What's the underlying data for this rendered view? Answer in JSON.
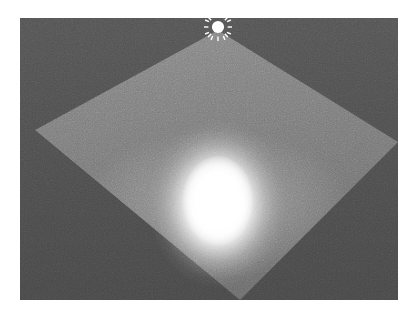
{
  "app": {
    "title": "3D Light Viewport",
    "scene_name": "Point light on ground plane"
  },
  "viewport": {
    "label": "render-viewport",
    "width_px": 378,
    "height_px": 282,
    "background_color": "#4c4c4c",
    "frame_color": "#6e6e6e"
  },
  "scene": {
    "ground_plane": {
      "label": "ground-plane",
      "shape": "quad",
      "base_color": "#787878",
      "highlight_color": "#8a8a8a",
      "shadow_color": "#676767",
      "grid_color": "#787878",
      "grid_visible_in_highlight": true,
      "corners_percent": [
        {
          "name": "top",
          "x": 52.4,
          "y": 4.3
        },
        {
          "name": "right",
          "x": 100.0,
          "y": 44.0
        },
        {
          "name": "bottom",
          "x": 58.2,
          "y": 100.0
        },
        {
          "name": "left",
          "x": 4.0,
          "y": 39.7
        }
      ]
    },
    "light": {
      "label": "point-light",
      "gizmo_icon": "sun-icon",
      "gizmo_color": "#ffffff",
      "gizmo_position_px": {
        "x": 218,
        "y": 27
      },
      "gizmo_ray_count": 12,
      "hotspot": {
        "label": "specular-hotspot",
        "color": "#ffffff",
        "center_percent": {
          "x": 52.5,
          "y": 66.0
        },
        "radius_x_px": 70,
        "radius_y_px": 85
      }
    },
    "effects": {
      "film_grain": true,
      "grain_opacity": 0.38
    }
  }
}
